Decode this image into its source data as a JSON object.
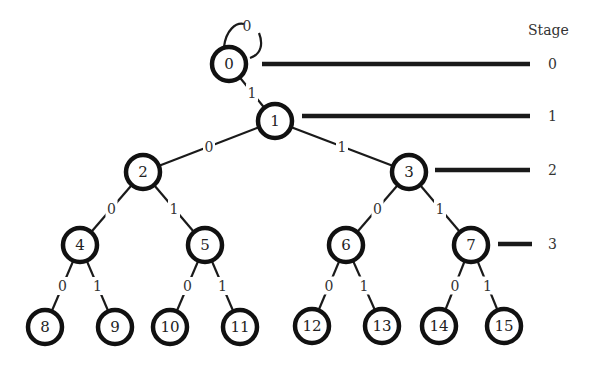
{
  "diagram": {
    "type": "binary-tree",
    "stage_header": "Stage",
    "self_loop": {
      "node": "0",
      "label": "0"
    },
    "nodes": [
      {
        "id": "0",
        "label": "0",
        "x": 229,
        "y": 64,
        "stage": 0
      },
      {
        "id": "1",
        "label": "1",
        "x": 275,
        "y": 121,
        "stage": 1
      },
      {
        "id": "2",
        "label": "2",
        "x": 143,
        "y": 172,
        "stage": 2
      },
      {
        "id": "3",
        "label": "3",
        "x": 409,
        "y": 172,
        "stage": 2
      },
      {
        "id": "4",
        "label": "4",
        "x": 80,
        "y": 245,
        "stage": 3
      },
      {
        "id": "5",
        "label": "5",
        "x": 205,
        "y": 245,
        "stage": 3
      },
      {
        "id": "6",
        "label": "6",
        "x": 346,
        "y": 245,
        "stage": 3
      },
      {
        "id": "7",
        "label": "7",
        "x": 471,
        "y": 245,
        "stage": 3
      },
      {
        "id": "8",
        "label": "8",
        "x": 45,
        "y": 327
      },
      {
        "id": "9",
        "label": "9",
        "x": 115,
        "y": 327
      },
      {
        "id": "10",
        "label": "10",
        "x": 170,
        "y": 327
      },
      {
        "id": "11",
        "label": "11",
        "x": 240,
        "y": 327
      },
      {
        "id": "12",
        "label": "12",
        "x": 312,
        "y": 326
      },
      {
        "id": "13",
        "label": "13",
        "x": 382,
        "y": 326
      },
      {
        "id": "14",
        "label": "14",
        "x": 439,
        "y": 326
      },
      {
        "id": "15",
        "label": "15",
        "x": 504,
        "y": 326
      }
    ],
    "edges": [
      {
        "from": "0",
        "to": "1",
        "label": "1"
      },
      {
        "from": "1",
        "to": "2",
        "label": "0"
      },
      {
        "from": "1",
        "to": "3",
        "label": "1"
      },
      {
        "from": "2",
        "to": "4",
        "label": "0"
      },
      {
        "from": "2",
        "to": "5",
        "label": "1"
      },
      {
        "from": "3",
        "to": "6",
        "label": "0"
      },
      {
        "from": "3",
        "to": "7",
        "label": "1"
      },
      {
        "from": "4",
        "to": "8",
        "label": "0"
      },
      {
        "from": "4",
        "to": "9",
        "label": "1"
      },
      {
        "from": "5",
        "to": "10",
        "label": "0"
      },
      {
        "from": "5",
        "to": "11",
        "label": "1"
      },
      {
        "from": "6",
        "to": "12",
        "label": "0"
      },
      {
        "from": "6",
        "to": "13",
        "label": "1"
      },
      {
        "from": "7",
        "to": "14",
        "label": "0"
      },
      {
        "from": "7",
        "to": "15",
        "label": "1"
      }
    ],
    "stages": [
      {
        "label": "0",
        "x1": 262,
        "x2": 530,
        "y": 64
      },
      {
        "label": "1",
        "x1": 302,
        "x2": 530,
        "y": 116
      },
      {
        "label": "2",
        "x1": 435,
        "x2": 530,
        "y": 170
      },
      {
        "label": "3",
        "x1": 498,
        "x2": 532,
        "y": 244
      }
    ]
  }
}
